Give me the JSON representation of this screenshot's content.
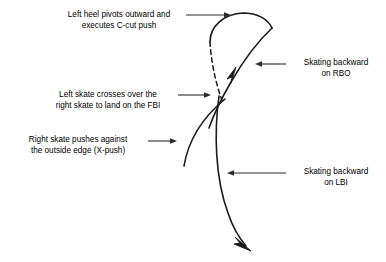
{
  "diagram": {
    "stroke_color": "#1a1a1a",
    "text_color": "#000000",
    "background_color": "#ffffff",
    "annotations": [
      {
        "id": "heel",
        "line1": "Left heel pivots outward and",
        "line2": "executes C-cut push",
        "leader": "arrow-right"
      },
      {
        "id": "cross",
        "line1": "Left skate crosses over the",
        "line2": "right skate to land on the FBI",
        "leader": "arrow-right"
      },
      {
        "id": "xpush",
        "line1": "Right skate pushes against",
        "line2": "the outside edge (X-push)",
        "leader": "arrow-right"
      },
      {
        "id": "rbo",
        "line1": "Skating backward",
        "line2": "on RBO",
        "leader": "arrow-left"
      },
      {
        "id": "lbi",
        "line1": "Skating backward",
        "line2": "on LBI",
        "leader": "arrow-left"
      }
    ]
  }
}
